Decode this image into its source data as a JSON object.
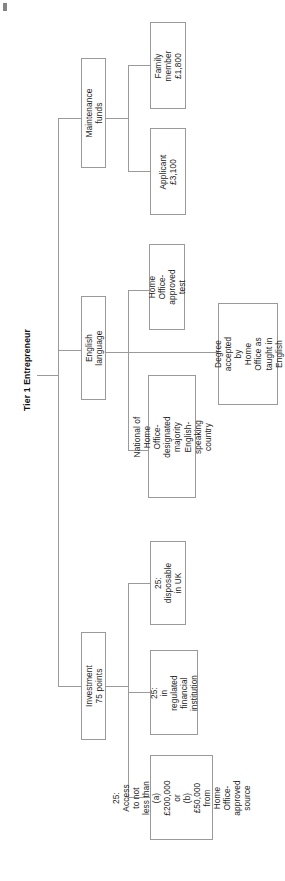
{
  "title": "Tier 1 Entrepreneur",
  "diagram": {
    "type": "tree",
    "orientation": "rotated-90-ccw",
    "root": "Tier 1 Entrepreneur",
    "branches": [
      {
        "id": "maintenance-funds",
        "label": "Maintenance funds",
        "children": [
          {
            "id": "family-member",
            "label": "Family member\n£1,800"
          },
          {
            "id": "applicant",
            "label": "Applicant\n£3,100"
          }
        ]
      },
      {
        "id": "english-language",
        "label": "English language",
        "children": [
          {
            "id": "approved-test",
            "label": "Home Office-\napproved test"
          },
          {
            "id": "degree-english",
            "label": "Degree accepted by\nHome Office as\ntaught in English"
          },
          {
            "id": "majority-english-country",
            "label": "National of Home Office-\ndesignated majority\nEnglish-speaking country"
          }
        ]
      },
      {
        "id": "investment",
        "label": "Investment 75 points",
        "children": [
          {
            "id": "disposable-uk",
            "label": "25:\ndisposable\nin UK"
          },
          {
            "id": "regulated-institution",
            "label": "25:\nin regulated\nfinancial\ninstitution"
          },
          {
            "id": "access-funds",
            "label": "25:\nAccess to not\nless than\n(a) £200,000 or\n(b) £50,000 from\nHome Office-\napproved source"
          }
        ]
      }
    ]
  },
  "colors": {
    "box_border": "#9a9a9a",
    "connector": "#9a9a9a",
    "text": "#1b1b1b",
    "background": "#ffffff"
  }
}
